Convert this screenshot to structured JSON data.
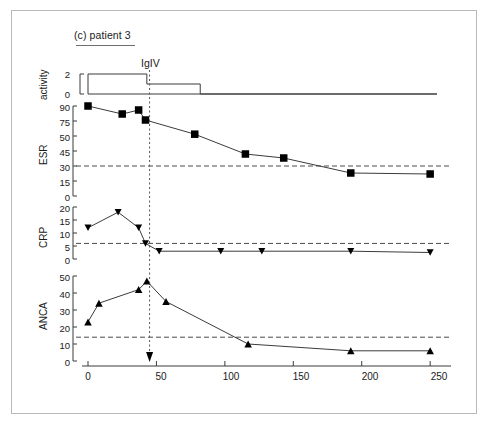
{
  "figure": {
    "title": "(c) patient 3",
    "intervention_label": "IgIV",
    "intervention_day": 45,
    "xaxis_title": "time (days)"
  },
  "chart_data": {
    "type": "line",
    "title": "(c) patient 3",
    "xlabel": "time (days)",
    "xlim": [
      0,
      255
    ],
    "xticks": [
      0,
      50,
      100,
      150,
      200,
      250
    ],
    "grid": false,
    "legend": "none",
    "annotations": [
      {
        "text": "IgIV",
        "x": 45,
        "style": "dotted-vertical-line-with-down-arrow"
      }
    ],
    "panels": [
      {
        "name": "activity",
        "ylabel": "activity",
        "ylim": [
          0,
          2.4
        ],
        "yticks": [
          0,
          2
        ],
        "type": "step",
        "marker": "none",
        "steps": [
          {
            "x_start": 0,
            "x_end": 43,
            "value": 2
          },
          {
            "x_start": 43,
            "x_end": 82,
            "value": 1
          },
          {
            "x_start": 82,
            "x_end": 255,
            "value": 0
          }
        ]
      },
      {
        "name": "ESR",
        "ylabel": "ESR",
        "ylim": [
          0,
          97
        ],
        "yticks": [
          0,
          15,
          30,
          45,
          50,
          75,
          90
        ],
        "ytick_labels": [
          "0",
          "15",
          "30",
          "45",
          "50",
          "75",
          "90"
        ],
        "reference_line": 30,
        "marker": "filled-square",
        "x": [
          0,
          25,
          37,
          42,
          78,
          115,
          143,
          192,
          250
        ],
        "values": [
          90,
          82,
          86,
          76,
          53,
          42,
          38,
          23,
          22
        ]
      },
      {
        "name": "CRP",
        "ylabel": "CRP",
        "ylim": [
          0,
          21
        ],
        "yticks": [
          0,
          5,
          10,
          15,
          20
        ],
        "reference_line": 6,
        "marker": "filled-down-triangle",
        "x": [
          0,
          22,
          37,
          42,
          52,
          97,
          127,
          192,
          250
        ],
        "values": [
          12,
          18,
          12,
          6,
          3,
          3,
          3,
          3,
          2.5
        ]
      },
      {
        "name": "ANCA",
        "ylabel": "ANCA",
        "ylim": [
          0,
          53
        ],
        "yticks": [
          0,
          10,
          20,
          30,
          40,
          50
        ],
        "reference_line": 14,
        "marker": "filled-up-triangle",
        "x": [
          0,
          8,
          37,
          43,
          57,
          117,
          192,
          250
        ],
        "values": [
          23,
          34,
          42,
          47,
          35,
          10,
          6,
          6
        ]
      }
    ]
  }
}
